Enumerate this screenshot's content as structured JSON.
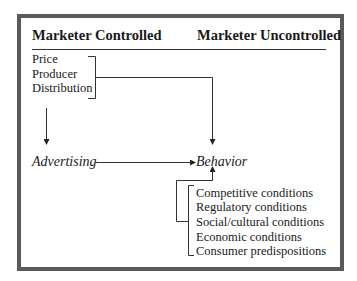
{
  "diagram": {
    "headers": {
      "controlled": "Marketer Controlled",
      "uncontrolled": "Marketer Uncontrolled"
    },
    "controlled_factors": [
      "Price",
      "Producer",
      "Distribution"
    ],
    "nodes": {
      "advertising": "Advertising",
      "behavior": "Behavior"
    },
    "uncontrolled_factors": [
      "Competitive conditions",
      "Regulatory conditions",
      "Social/cultural conditions",
      "Economic conditions",
      "Consumer predispositions"
    ],
    "edges": [
      {
        "from": "controlled_factors",
        "to": "advertising"
      },
      {
        "from": "controlled_factors",
        "to": "behavior"
      },
      {
        "from": "advertising",
        "to": "behavior"
      },
      {
        "from": "uncontrolled_factors",
        "to": "behavior"
      }
    ],
    "colors": {
      "border": "#5a5a5a",
      "line": "#333333",
      "text": "#1a1a1a"
    }
  }
}
